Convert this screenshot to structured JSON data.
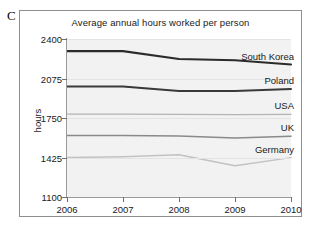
{
  "figure": {
    "letter": "C",
    "title": "Average annual hours worked per person"
  },
  "axes": {
    "ylabel": "hours",
    "yticks": [
      "2400",
      "2075",
      "1750",
      "1425",
      "1100"
    ],
    "xticks": [
      "2006",
      "2007",
      "2008",
      "2009",
      "2010"
    ]
  },
  "labels": {
    "south_korea": "South Korea",
    "poland": "Poland",
    "usa": "USA",
    "uk": "UK",
    "germany": "Germany"
  },
  "colors": {
    "south_korea": "#2b2b2b",
    "poland": "#3a3a3a",
    "usa": "#b4b4b4",
    "uk": "#8a8a8a",
    "germany": "#c2c2c2",
    "plot_background": "#f2f2f2",
    "frame": "#8e8e8e",
    "gridline": "#e3e3e3"
  },
  "chart_data": {
    "type": "line",
    "title": "Average annual hours worked per person",
    "xlabel": "",
    "ylabel": "hours",
    "x": [
      2006,
      2007,
      2008,
      2009,
      2010
    ],
    "xlim": [
      2006,
      2010
    ],
    "ylim": [
      1100,
      2400
    ],
    "ytick_values": [
      2400,
      2075,
      1750,
      1425,
      1100
    ],
    "grid": true,
    "legend": "inline-right-labels",
    "series": [
      {
        "name": "South Korea",
        "values": [
          2300,
          2300,
          2235,
          2225,
          2190
        ],
        "color": "#2b2b2b",
        "width": 2.1
      },
      {
        "name": "Poland",
        "values": [
          2010,
          2010,
          1972,
          1972,
          1988
        ],
        "color": "#3a3a3a",
        "width": 2.0
      },
      {
        "name": "USA",
        "values": [
          1782,
          1782,
          1780,
          1778,
          1780
        ],
        "color": "#b4b4b4",
        "width": 1.4
      },
      {
        "name": "UK",
        "values": [
          1605,
          1605,
          1602,
          1585,
          1600
        ],
        "color": "#8a8a8a",
        "width": 1.5
      },
      {
        "name": "Germany",
        "values": [
          1425,
          1432,
          1448,
          1358,
          1424
        ],
        "color": "#c2c2c2",
        "width": 1.5
      }
    ]
  }
}
